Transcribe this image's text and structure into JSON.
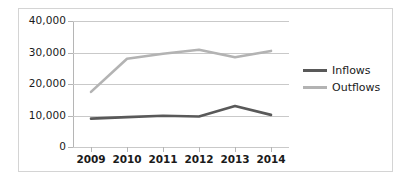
{
  "chart_data": {
    "type": "line",
    "title": "",
    "xlabel": "",
    "ylabel": "",
    "categories": [
      "2009",
      "2010",
      "2011",
      "2012",
      "2013",
      "2014"
    ],
    "series": [
      {
        "name": "Inflows",
        "color": "#595959",
        "values": [
          9000,
          9500,
          9900,
          9700,
          13000,
          10200
        ]
      },
      {
        "name": "Outflows",
        "color": "#b3b3b3",
        "values": [
          17500,
          28000,
          29600,
          30900,
          28500,
          30500
        ]
      }
    ],
    "ylim": [
      0,
      40000
    ],
    "yticks": [
      0,
      10000,
      20000,
      30000,
      40000
    ],
    "ytick_labels": [
      "0",
      "10,000",
      "20,000",
      "30,000",
      "40,000"
    ],
    "grid": true,
    "legend_position": "right"
  },
  "legend": {
    "entries": [
      {
        "label": "Inflows",
        "color": "#595959"
      },
      {
        "label": "Outflows",
        "color": "#b3b3b3"
      }
    ]
  },
  "axes": {
    "y_labels": [
      "40,000",
      "30,000",
      "20,000",
      "10,000",
      "0"
    ],
    "x_labels": [
      "2009",
      "2010",
      "2011",
      "2012",
      "2013",
      "2014"
    ]
  }
}
